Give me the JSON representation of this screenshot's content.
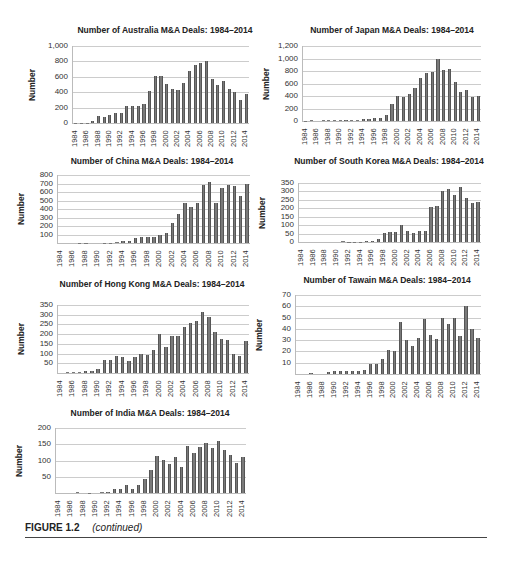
{
  "figure": {
    "label": "FIGURE 1.2",
    "note": "(continued)"
  },
  "chart_data": [
    {
      "type": "bar",
      "title": "Number of Australia M&A Deals: 1984–2014",
      "xlabel": "",
      "ylabel": "Number",
      "ylim": [
        0,
        1000
      ],
      "yticks": [
        "0",
        "200",
        "400",
        "600",
        "800",
        "1,000"
      ],
      "ytick_values": [
        0,
        200,
        400,
        600,
        800,
        1000
      ],
      "xtick_labels": [
        "1984",
        "1986",
        "1988",
        "1990",
        "1992",
        "1994",
        "1996",
        "1998",
        "2000",
        "2002",
        "2004",
        "2006",
        "2008",
        "2010",
        "2012",
        "2014"
      ],
      "categories": [
        "1984",
        "1985",
        "1986",
        "1987",
        "1988",
        "1989",
        "1990",
        "1991",
        "1992",
        "1993",
        "1994",
        "1995",
        "1996",
        "1997",
        "1998",
        "1999",
        "2000",
        "2001",
        "2002",
        "2003",
        "2004",
        "2005",
        "2006",
        "2007",
        "2008",
        "2009",
        "2010",
        "2011",
        "2012",
        "2013",
        "2014"
      ],
      "values": [
        5,
        5,
        5,
        30,
        95,
        75,
        110,
        135,
        125,
        225,
        215,
        225,
        245,
        415,
        605,
        605,
        505,
        445,
        425,
        515,
        670,
        750,
        775,
        810,
        575,
        490,
        545,
        440,
        400,
        305,
        375
      ],
      "grid": true,
      "layout": {
        "left": 72,
        "top": 46,
        "width": 176,
        "height": 77,
        "title_x": 165,
        "title_y": 31
      }
    },
    {
      "type": "bar",
      "title": "Number of Japan M&A Deals: 1984–2014",
      "xlabel": "",
      "ylabel": "Number",
      "ylim": [
        0,
        1200
      ],
      "yticks": [
        "0",
        "200",
        "400",
        "600",
        "800",
        "1,000",
        "1,200"
      ],
      "ytick_values": [
        0,
        200,
        400,
        600,
        800,
        1000,
        1200
      ],
      "xtick_labels": [
        "1984",
        "1986",
        "1988",
        "1990",
        "1992",
        "1994",
        "1996",
        "1998",
        "2000",
        "2002",
        "2004",
        "2006",
        "2008",
        "2010",
        "2012",
        "2014"
      ],
      "categories": [
        "1984",
        "1985",
        "1986",
        "1987",
        "1988",
        "1989",
        "1990",
        "1991",
        "1992",
        "1993",
        "1994",
        "1995",
        "1996",
        "1997",
        "1998",
        "1999",
        "2000",
        "2001",
        "2002",
        "2003",
        "2004",
        "2005",
        "2006",
        "2007",
        "2008",
        "2009",
        "2010",
        "2011",
        "2012",
        "2013",
        "2014"
      ],
      "values": [
        5,
        10,
        0,
        10,
        10,
        15,
        15,
        20,
        15,
        15,
        25,
        25,
        45,
        50,
        95,
        275,
        400,
        385,
        440,
        535,
        695,
        775,
        790,
        1000,
        815,
        830,
        620,
        465,
        490,
        380,
        405
      ],
      "grid": true,
      "layout": {
        "left": 302,
        "top": 46,
        "width": 178,
        "height": 75,
        "title_x": 392,
        "title_y": 31
      }
    },
    {
      "type": "bar",
      "title": "Number of China M&A Deals: 1984–2014",
      "xlabel": "",
      "ylabel": "Number",
      "ylim": [
        0,
        800
      ],
      "yticks": [
        "100",
        "200",
        "300",
        "400",
        "500",
        "600",
        "700",
        "800"
      ],
      "ytick_values": [
        100,
        200,
        300,
        400,
        500,
        600,
        700,
        800
      ],
      "xtick_labels": [
        "1984",
        "1986",
        "1988",
        "1990",
        "1992",
        "1994",
        "1996",
        "1998",
        "2000",
        "2002",
        "2004",
        "2006",
        "2008",
        "2010",
        "2012",
        "2014"
      ],
      "categories": [
        "1984",
        "1985",
        "1986",
        "1987",
        "1988",
        "1989",
        "1990",
        "1991",
        "1992",
        "1993",
        "1994",
        "1995",
        "1996",
        "1997",
        "1998",
        "1999",
        "2000",
        "2001",
        "2002",
        "2003",
        "2004",
        "2005",
        "2006",
        "2007",
        "2008",
        "2009",
        "2010",
        "2011",
        "2012",
        "2013",
        "2014"
      ],
      "values": [
        0,
        0,
        0,
        5,
        5,
        0,
        0,
        5,
        5,
        10,
        25,
        20,
        55,
        70,
        75,
        70,
        90,
        120,
        230,
        345,
        470,
        420,
        465,
        685,
        715,
        475,
        645,
        680,
        665,
        550,
        695
      ],
      "grid": true,
      "layout": {
        "left": 57,
        "top": 175,
        "width": 192,
        "height": 68,
        "title_x": 152,
        "title_y": 162
      }
    },
    {
      "type": "bar",
      "title": "Number of South Korea M&A Deals: 1984–2014",
      "xlabel": "",
      "ylabel": "Number",
      "ylim": [
        0,
        350
      ],
      "yticks": [
        "0",
        "50",
        "100",
        "150",
        "200",
        "250",
        "300",
        "350"
      ],
      "ytick_values": [
        0,
        50,
        100,
        150,
        200,
        250,
        300,
        350
      ],
      "xtick_labels": [
        "1984",
        "1986",
        "1988",
        "1990",
        "1992",
        "1994",
        "1996",
        "1998",
        "2000",
        "2002",
        "2004",
        "2006",
        "2008",
        "2010",
        "2012",
        "2014"
      ],
      "categories": [
        "1984",
        "1985",
        "1986",
        "1987",
        "1988",
        "1989",
        "1990",
        "1991",
        "1992",
        "1993",
        "1994",
        "1995",
        "1996",
        "1997",
        "1998",
        "1999",
        "2000",
        "2001",
        "2002",
        "2003",
        "2004",
        "2005",
        "2006",
        "2007",
        "2008",
        "2009",
        "2010",
        "2011",
        "2012",
        "2013",
        "2014"
      ],
      "values": [
        0,
        0,
        0,
        0,
        0,
        0,
        0,
        5,
        3,
        3,
        3,
        8,
        8,
        15,
        55,
        60,
        60,
        100,
        65,
        55,
        65,
        65,
        205,
        215,
        305,
        315,
        280,
        325,
        260,
        230,
        240
      ],
      "grid": true,
      "layout": {
        "left": 298,
        "top": 183,
        "width": 182,
        "height": 59,
        "title_x": 389,
        "title_y": 162
      }
    },
    {
      "type": "bar",
      "title": "Number of Hong Kong M&A Deals: 1984–2014",
      "xlabel": "",
      "ylabel": "Number",
      "ylim": [
        0,
        350
      ],
      "yticks": [
        "50",
        "100",
        "150",
        "200",
        "250",
        "300",
        "350"
      ],
      "ytick_values": [
        50,
        100,
        150,
        200,
        250,
        300,
        350
      ],
      "xtick_labels": [
        "1984",
        "1986",
        "1988",
        "1990",
        "1992",
        "1994",
        "1996",
        "1998",
        "2000",
        "2002",
        "2004",
        "2006",
        "2008",
        "2010",
        "2012",
        "2014"
      ],
      "categories": [
        "1984",
        "1985",
        "1986",
        "1987",
        "1988",
        "1989",
        "1990",
        "1991",
        "1992",
        "1993",
        "1994",
        "1995",
        "1996",
        "1997",
        "1998",
        "1999",
        "2000",
        "2001",
        "2002",
        "2003",
        "2004",
        "2005",
        "2006",
        "2007",
        "2008",
        "2009",
        "2010",
        "2011",
        "2012",
        "2013",
        "2014"
      ],
      "values": [
        0,
        5,
        5,
        5,
        10,
        10,
        20,
        65,
        65,
        88,
        82,
        60,
        85,
        100,
        95,
        120,
        200,
        135,
        190,
        188,
        235,
        260,
        270,
        315,
        290,
        212,
        175,
        170,
        100,
        90,
        165
      ],
      "grid": true,
      "layout": {
        "left": 57,
        "top": 305,
        "width": 191,
        "height": 68,
        "title_x": 152,
        "title_y": 285
      }
    },
    {
      "type": "bar",
      "title": "Number of Tawain M&A Deals: 1984–2014",
      "xlabel": "",
      "ylabel": "Number",
      "ylim": [
        0,
        70
      ],
      "yticks": [
        "10",
        "20",
        "30",
        "40",
        "50",
        "60",
        "70"
      ],
      "ytick_values": [
        10,
        20,
        30,
        40,
        50,
        60,
        70
      ],
      "xtick_labels": [
        "1984",
        "1986",
        "1988",
        "1990",
        "1992",
        "1994",
        "1996",
        "1998",
        "2000",
        "2002",
        "2004",
        "2006",
        "2008",
        "2010",
        "2012",
        "2014"
      ],
      "categories": [
        "1984",
        "1985",
        "1986",
        "1987",
        "1988",
        "1989",
        "1990",
        "1991",
        "1992",
        "1993",
        "1994",
        "1995",
        "1996",
        "1997",
        "1998",
        "1999",
        "2000",
        "2001",
        "2002",
        "2003",
        "2004",
        "2005",
        "2006",
        "2007",
        "2008",
        "2009",
        "2010",
        "2011",
        "2012",
        "2013",
        "2014"
      ],
      "values": [
        0,
        0,
        1,
        0,
        0,
        2,
        3,
        3,
        3,
        3,
        3,
        4,
        9,
        9,
        13,
        21,
        20,
        46,
        30,
        25,
        32,
        49,
        35,
        31,
        50,
        44,
        50,
        34,
        60,
        40,
        32
      ],
      "grid": true,
      "layout": {
        "left": 295,
        "top": 295,
        "width": 185,
        "height": 79,
        "title_x": 387,
        "title_y": 281
      }
    },
    {
      "type": "bar",
      "title": "Number of India M&A Deals: 1984–2014",
      "xlabel": "",
      "ylabel": "Number",
      "ylim": [
        0,
        200
      ],
      "yticks": [
        "50",
        "100",
        "150",
        "200"
      ],
      "ytick_values": [
        50,
        100,
        150,
        200
      ],
      "xtick_labels": [
        "1984",
        "1986",
        "1988",
        "1990",
        "1992",
        "1994",
        "1996",
        "1998",
        "2000",
        "2002",
        "2004",
        "2006",
        "2008",
        "2010",
        "2012",
        "2014"
      ],
      "categories": [
        "1984",
        "1985",
        "1986",
        "1987",
        "1988",
        "1989",
        "1990",
        "1991",
        "1992",
        "1993",
        "1994",
        "1995",
        "1996",
        "1997",
        "1998",
        "1999",
        "2000",
        "2001",
        "2002",
        "2003",
        "2004",
        "2005",
        "2006",
        "2007",
        "2008",
        "2009",
        "2010",
        "2011",
        "2012",
        "2013",
        "2014"
      ],
      "values": [
        0,
        0,
        0,
        2,
        0,
        1,
        0,
        2,
        4,
        11,
        13,
        26,
        12,
        26,
        43,
        72,
        115,
        102,
        90,
        112,
        80,
        146,
        123,
        142,
        153,
        140,
        161,
        132,
        117,
        93,
        110
      ],
      "grid": true,
      "layout": {
        "left": 55,
        "top": 428,
        "width": 190,
        "height": 65,
        "title_x": 150,
        "title_y": 414
      }
    }
  ]
}
